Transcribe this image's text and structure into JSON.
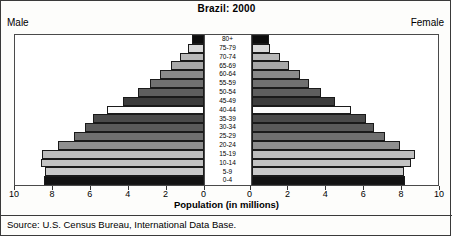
{
  "title": "Brazil: 2000",
  "male_label": "Male",
  "female_label": "Female",
  "xlabel": "Population (in millions)",
  "source": "Source: U.S. Census Bureau, International Data Base.",
  "chart_data": {
    "type": "bar",
    "subtype": "population-pyramid",
    "title": "Brazil: 2000",
    "xlabel": "Population (in millions)",
    "ylabel": "",
    "xlim": [
      0,
      10
    ],
    "xticks": [
      0,
      2,
      4,
      6,
      8,
      10
    ],
    "grid": false,
    "legend": "none",
    "categories": [
      "0-4",
      "5-9",
      "10-14",
      "15-19",
      "20-24",
      "25-29",
      "30-34",
      "35-39",
      "40-44",
      "45-49",
      "50-54",
      "55-59",
      "60-64",
      "65-69",
      "70-74",
      "75-79",
      "80+"
    ],
    "series": [
      {
        "name": "Male",
        "values": [
          8.45,
          8.4,
          8.6,
          8.55,
          7.7,
          6.85,
          6.3,
          5.85,
          5.1,
          4.25,
          3.5,
          2.85,
          2.3,
          1.75,
          1.25,
          0.8,
          0.6
        ]
      },
      {
        "name": "Female",
        "values": [
          8.15,
          8.1,
          8.45,
          8.65,
          7.9,
          7.1,
          6.5,
          6.05,
          5.3,
          4.45,
          3.7,
          3.05,
          2.55,
          2.0,
          1.5,
          1.0,
          0.95
        ]
      }
    ],
    "bar_colors": [
      "#121212",
      "#c9c9c9",
      "#c2c2c2",
      "#bdbdbd",
      "#8f8f8f",
      "#6f6f6f",
      "#5a5a5a",
      "#4a4a4a",
      "#fbfbfb",
      "#3c3c3c",
      "#5e5e5e",
      "#707070",
      "#8a8a8a",
      "#a8a8a8",
      "#b8b8b8",
      "#d9d9d9",
      "#0d0d0d"
    ]
  }
}
